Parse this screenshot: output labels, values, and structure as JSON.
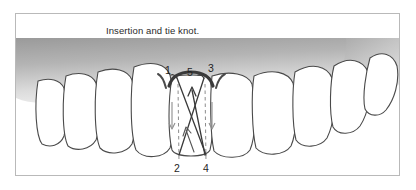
{
  "figure": {
    "caption": "Insertion and tie knot.",
    "frame_border_color": "#b9b9b9",
    "background_color": "#ffffff"
  },
  "diagram": {
    "type": "dental-suture-illustration",
    "gingiva": {
      "name": "gingiva-band",
      "fill_dark": "#8e8e8e",
      "fill_light": "#f2f2f2",
      "margin_color": "#3a3a3a"
    },
    "tooth_fill": "#ffffff",
    "tooth_outline": "#4a4a4a",
    "suture_color": "#3a3a3a",
    "guide_line_color": "#8d8d8d",
    "arrow_color": "#8d8d8d",
    "labels": [
      {
        "id": "label-1",
        "text": "1",
        "x": 156,
        "y": 58
      },
      {
        "id": "label-5",
        "text": "5",
        "x": 177,
        "y": 60
      },
      {
        "id": "label-3",
        "text": "3",
        "x": 196,
        "y": 57
      },
      {
        "id": "label-2",
        "text": "2",
        "x": 161,
        "y": 158
      },
      {
        "id": "label-4",
        "text": "4",
        "x": 190,
        "y": 158
      }
    ],
    "needle_points": [
      {
        "label": "1",
        "role": "entry-mesial-papilla-buccal"
      },
      {
        "label": "2",
        "role": "exit-mesial-lingual"
      },
      {
        "label": "3",
        "role": "entry-distal-papilla-buccal"
      },
      {
        "label": "4",
        "role": "exit-distal-lingual"
      },
      {
        "label": "5",
        "role": "knot-tie-point"
      }
    ],
    "tooth_count_visible": 9
  }
}
